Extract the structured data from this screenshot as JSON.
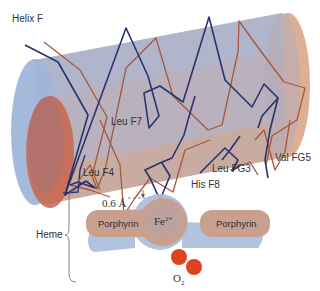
{
  "diagram": {
    "labels": {
      "helix": "Helix F",
      "leu_f7": "Leu F7",
      "leu_f4": "Leu F4",
      "leu_fg3": "Leu FG3",
      "val_fg5": "Val FG5",
      "his_f8": "His F8",
      "distance": "0.6 Å",
      "heme": "Heme",
      "porphyrin_left": "Porphyrin",
      "porphyrin_right": "Porphyrin",
      "iron": "Fe",
      "iron_charge": "2+",
      "oxygen": "O",
      "oxygen_sub": "2"
    },
    "colors": {
      "cylinder_blue": "#9fb6d9",
      "cylinder_tan": "#d9a68a",
      "cylinder_body": "#b3abb8",
      "cap_red": "#c7654d",
      "chain_dark": "#2a3370",
      "chain_brown": "#a8573a",
      "porphyrin_tan": "#c9a08e",
      "porphyrin_blue": "#a9bcdc",
      "oxygen_red": "#e0421f"
    }
  }
}
